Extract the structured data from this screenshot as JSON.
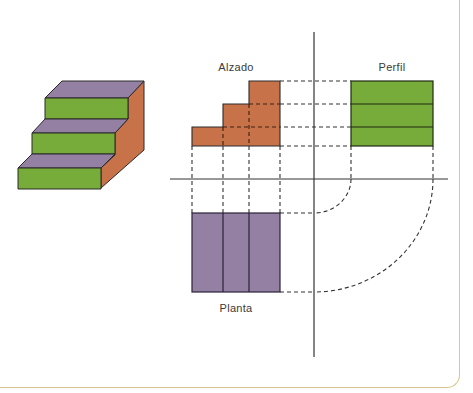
{
  "labels": {
    "elevation": "Alzado",
    "profile": "Perfil",
    "plan": "Planta"
  },
  "colors": {
    "riser_green": "#77ab3a",
    "tread_purple": "#9480a2",
    "side_brown": "#c8724a",
    "outline": "#2a2a2a",
    "frame_border": "#d8c68c"
  },
  "figure": {
    "object": "three-step staircase (isometric)",
    "views": [
      "Alzado",
      "Perfil",
      "Planta"
    ],
    "steps": 3
  }
}
